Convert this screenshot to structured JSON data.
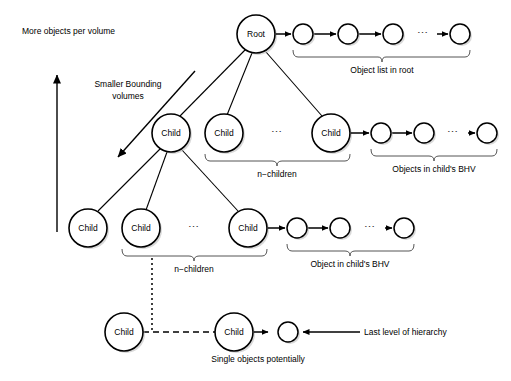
{
  "diagram": {
    "background_color": "#ffffff",
    "stroke_color": "#000000",
    "brace_color": "#555555"
  },
  "annotations": {
    "vertical_axis_label": "More objects per volume",
    "diagonal_axis_label_line1": "Smaller Bounding",
    "diagonal_axis_label_line2": "volumes",
    "last_level_label": "Last level of hierarchy",
    "single_objects_label": "Single objects potentially"
  },
  "nodes": {
    "root": {
      "label": "Root",
      "cx": 256,
      "cy": 34,
      "r": 19
    },
    "level2": [
      {
        "label": "Child",
        "cx": 171,
        "cy": 133,
        "r": 19
      },
      {
        "label": "Child",
        "cx": 224,
        "cy": 133,
        "r": 19
      },
      {
        "label": "Child",
        "cx": 331,
        "cy": 133,
        "r": 19
      }
    ],
    "level3": [
      {
        "label": "Child",
        "cx": 88,
        "cy": 228,
        "r": 19
      },
      {
        "label": "Child",
        "cx": 141,
        "cy": 228,
        "r": 19
      },
      {
        "label": "Child",
        "cx": 248,
        "cy": 228,
        "r": 19
      }
    ],
    "level4": [
      {
        "label": "Child",
        "cx": 124,
        "cy": 332,
        "r": 19
      },
      {
        "label": "Child",
        "cx": 234,
        "cy": 332,
        "r": 19
      }
    ]
  },
  "chains": {
    "root_chain": {
      "caption": "Object list in root",
      "circles_x": [
        303,
        348,
        393,
        460
      ],
      "cy": 34,
      "r": 10,
      "ellipsis": "⋯",
      "ellipsis_x": 423,
      "brace_x1": 293,
      "brace_x2": 470,
      "brace_y": 55,
      "caption_y": 71
    },
    "level2_chain": {
      "caption": "Objects in child's BHV",
      "circles_x": [
        381,
        424,
        487
      ],
      "cy": 133,
      "r": 10,
      "ellipsis": "⋯",
      "ellipsis_x": 455,
      "brace_x1": 371,
      "brace_x2": 497,
      "brace_y": 154,
      "caption_y": 170
    },
    "level3_chain": {
      "caption": "Object in child's BHV",
      "circles_x": [
        297,
        340,
        404
      ],
      "cy": 228,
      "r": 10,
      "ellipsis": "⋯",
      "ellipsis_x": 372,
      "brace_x1": 287,
      "brace_x2": 414,
      "brace_y": 249,
      "caption_y": 265
    },
    "level4_chain": {
      "circles_x": [
        288
      ],
      "cy": 332,
      "r": 10
    }
  },
  "braces": {
    "n_children_level2": {
      "caption": "n−children",
      "x1": 205,
      "x2": 350,
      "y": 154,
      "caption_y": 170
    },
    "n_children_level3": {
      "caption": "n−children",
      "x1": 122,
      "x2": 267,
      "y": 249,
      "caption_y": 265
    }
  },
  "ellipses": {
    "level2_gap": {
      "glyph": "⋯",
      "x": 277,
      "y": 133
    },
    "level3_gap": {
      "glyph": "⋯",
      "x": 194,
      "y": 228
    }
  }
}
